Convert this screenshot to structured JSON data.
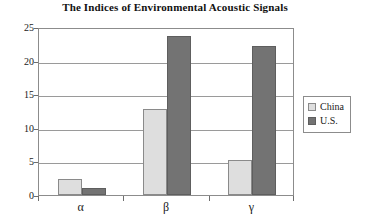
{
  "chart_data": {
    "type": "bar",
    "title": "The Indices of Environmental Acoustic Signals",
    "xlabel": "",
    "ylabel": "",
    "categories": [
      "α",
      "β",
      "γ"
    ],
    "series": [
      {
        "name": "China",
        "color": "#dedede",
        "values": [
          2.4,
          12.8,
          5.2
        ]
      },
      {
        "name": "U.S.",
        "color": "#737373",
        "values": [
          1.0,
          23.7,
          22.2
        ]
      }
    ],
    "ylim": [
      0,
      25
    ],
    "yticks": [
      0,
      5,
      10,
      15,
      20,
      25
    ],
    "ytick_labels": [
      "0",
      "5",
      "10",
      "15",
      "20",
      "25"
    ],
    "grid": true,
    "legend_position": "right"
  },
  "legend": {
    "entries": [
      {
        "label": "China"
      },
      {
        "label": "U.S."
      }
    ]
  }
}
